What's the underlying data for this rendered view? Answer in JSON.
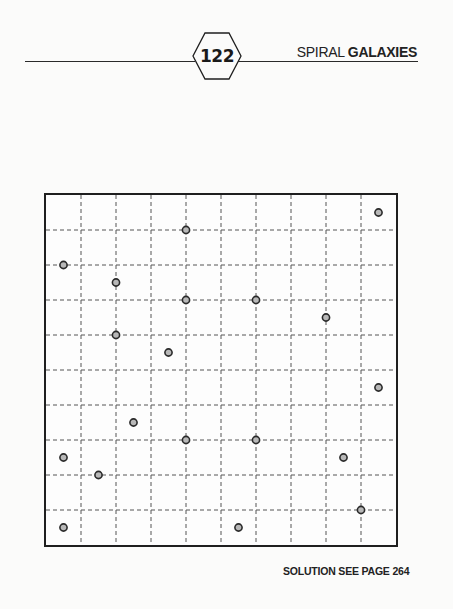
{
  "header": {
    "page_number": "122",
    "title_regular": "SPIRAL ",
    "title_bold": "GALAXIES"
  },
  "puzzle": {
    "type": "Spiral Galaxies",
    "grid_size": {
      "rows": 10,
      "cols": 10
    },
    "cell_px": 35,
    "colors": {
      "border": "#1f1f1f",
      "gridline": "#555555",
      "dot_fill": "#b8b8b8",
      "dot_outline": "#2a2a2a"
    },
    "dots": [
      {
        "col": 9.5,
        "row": 0.5
      },
      {
        "col": 4,
        "row": 1
      },
      {
        "col": 0.5,
        "row": 2
      },
      {
        "col": 2,
        "row": 2.5
      },
      {
        "col": 4,
        "row": 3
      },
      {
        "col": 6,
        "row": 3
      },
      {
        "col": 8,
        "row": 3.5
      },
      {
        "col": 2,
        "row": 4
      },
      {
        "col": 3.5,
        "row": 4.5
      },
      {
        "col": 9.5,
        "row": 5.5
      },
      {
        "col": 2.5,
        "row": 6.5
      },
      {
        "col": 4,
        "row": 7
      },
      {
        "col": 6,
        "row": 7
      },
      {
        "col": 0.5,
        "row": 7.5
      },
      {
        "col": 8.5,
        "row": 7.5
      },
      {
        "col": 1.5,
        "row": 8
      },
      {
        "col": 9,
        "row": 9
      },
      {
        "col": 0.5,
        "row": 9.5
      },
      {
        "col": 5.5,
        "row": 9.5
      }
    ]
  },
  "footer": {
    "solution_text": "SOLUTION SEE PAGE 264"
  }
}
